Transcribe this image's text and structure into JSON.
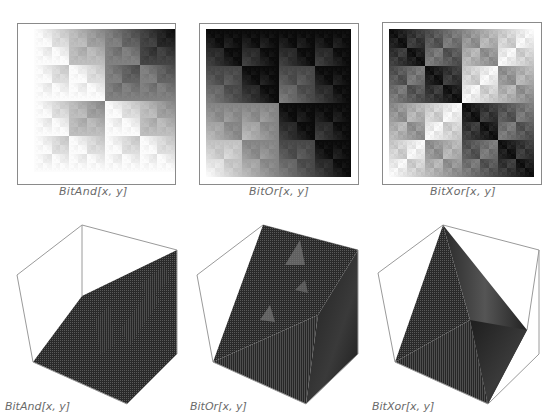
{
  "chart_data": [
    {
      "type": "heatmap",
      "title": "BitAnd[x, y]",
      "function": "BitAnd",
      "grid_size": 128,
      "colormap": "grayscale (white = low, black = high)",
      "axes": false,
      "frame": true
    },
    {
      "type": "heatmap",
      "title": "BitOr[x, y]",
      "function": "BitOr",
      "grid_size": 128,
      "colormap": "grayscale (white = low, black = high)",
      "axes": false,
      "frame": true
    },
    {
      "type": "heatmap",
      "title": "BitXor[x, y]",
      "function": "BitXor",
      "grid_size": 128,
      "colormap": "grayscale (white = low, black = high)",
      "axes": false,
      "frame": true
    },
    {
      "type": "surface3d",
      "title": "BitAnd[x, y]",
      "function": "BitAnd",
      "bounding_box": true,
      "shading": "dark mesh"
    },
    {
      "type": "surface3d",
      "title": "BitOr[x, y]",
      "function": "BitOr",
      "bounding_box": true,
      "shading": "dark mesh"
    },
    {
      "type": "surface3d",
      "title": "BitXor[x, y]",
      "function": "BitXor",
      "bounding_box": true,
      "shading": "dark mesh"
    }
  ],
  "labels": {
    "and": "BitAnd[x, y]",
    "or": "BitOr[x, y]",
    "xor": "BitXor[x, y]"
  },
  "colors": {
    "frame": "#8a8a8a",
    "label": "#6a6a6a",
    "surface": "#2e2e2e",
    "box": "#9a9a9a"
  }
}
